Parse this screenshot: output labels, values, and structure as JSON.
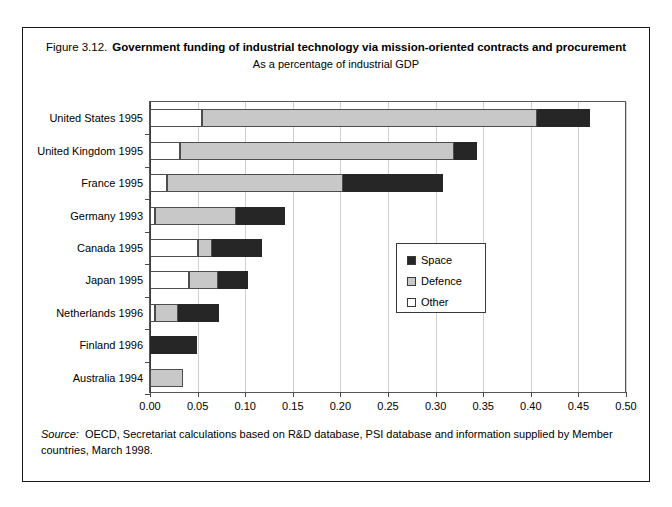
{
  "figure": {
    "number": "Figure 3.12.",
    "title": "Government funding of industrial technology via mission-oriented contracts and procurement",
    "subtitle": "As a percentage of industrial GDP",
    "source_word": "Source:",
    "source_text": "OECD, Secretariat calculations based on R&D database, PSI database and information supplied by Member countries, March 1998."
  },
  "colors": {
    "space": "#262626",
    "defence": "#c8c8c8",
    "other": "#ffffff",
    "frame": "#1a1a1a",
    "grid": "#cfcfcf"
  },
  "legend": {
    "position": "inside-right",
    "items": [
      {
        "label": "Space",
        "key": "space"
      },
      {
        "label": "Defence",
        "key": "defence"
      },
      {
        "label": "Other",
        "key": "other"
      }
    ]
  },
  "chart_data": {
    "type": "bar",
    "orientation": "horizontal",
    "stacked": true,
    "title": "Government funding of industrial technology via mission-oriented contracts and procurement",
    "subtitle": "As a percentage of industrial GDP",
    "xlabel": "",
    "ylabel": "",
    "xlim": [
      0.0,
      0.5
    ],
    "grid": true,
    "xticks": [
      0.0,
      0.05,
      0.1,
      0.15,
      0.2,
      0.25,
      0.3,
      0.35,
      0.4,
      0.45,
      0.5
    ],
    "xtick_labels": [
      "0.00",
      "0.05",
      "0.10",
      "0.15",
      "0.20",
      "0.25",
      "0.30",
      "0.35",
      "0.40",
      "0.45",
      "0.50"
    ],
    "categories": [
      "United States 1995",
      "United Kingdom 1995",
      "France 1995",
      "Germany 1993",
      "Canada 1995",
      "Japan 1995",
      "Netherlands 1996",
      "Finland 1996",
      "Australia 1994"
    ],
    "series": [
      {
        "name": "Other",
        "values": [
          0.055,
          0.031,
          0.018,
          0.005,
          0.05,
          0.041,
          0.005,
          0.0,
          0.0
        ]
      },
      {
        "name": "Defence",
        "values": [
          0.352,
          0.288,
          0.185,
          0.085,
          0.015,
          0.03,
          0.024,
          0.0,
          0.035
        ]
      },
      {
        "name": "Space",
        "values": [
          0.055,
          0.024,
          0.105,
          0.052,
          0.053,
          0.032,
          0.043,
          0.049,
          0.0
        ]
      }
    ],
    "totals": [
      0.462,
      0.343,
      0.308,
      0.142,
      0.118,
      0.103,
      0.072,
      0.049,
      0.035
    ]
  }
}
